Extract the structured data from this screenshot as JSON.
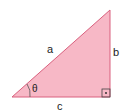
{
  "diagram": {
    "type": "right-triangle",
    "fill_color": "#f7b8c6",
    "stroke_color": "#d9607e",
    "labels": {
      "hypotenuse": "a",
      "vertical_side": "b",
      "base": "c",
      "angle": "θ"
    },
    "right_angle_marker": "square-with-dot"
  }
}
